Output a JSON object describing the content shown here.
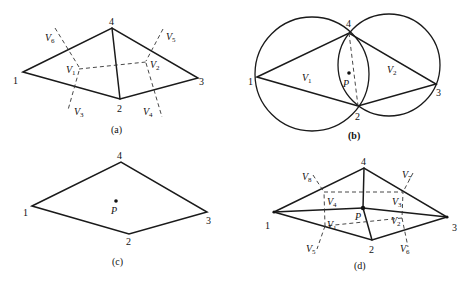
{
  "figures": {
    "a": {
      "caption": "(a)",
      "nodes": {
        "n1": "1",
        "n2": "2",
        "n3": "3",
        "n4": "4"
      },
      "voronoi": {
        "v1": "1",
        "v2": "2",
        "v3": "3",
        "v4": "4",
        "v5": "5",
        "v6": "6"
      }
    },
    "b": {
      "caption": "(b)",
      "nodes": {
        "n1": "1",
        "n2": "2",
        "n3": "3",
        "n4": "4"
      },
      "voronoi": {
        "v1": "1",
        "v2": "2"
      },
      "point": "P"
    },
    "c": {
      "caption": "(c)",
      "nodes": {
        "n1": "1",
        "n2": "2",
        "n3": "3",
        "n4": "4"
      },
      "point": "P"
    },
    "d": {
      "caption": "(d)",
      "nodes": {
        "n1": "1",
        "n2": "2",
        "n3": "3",
        "n4": "4"
      },
      "voronoi": {
        "v1": "1",
        "v2": "2",
        "v3": "3",
        "v4": "4",
        "v5": "5",
        "v6": "6",
        "v7": "7",
        "v8": "8"
      },
      "point": "P"
    }
  },
  "v_letter": "V"
}
